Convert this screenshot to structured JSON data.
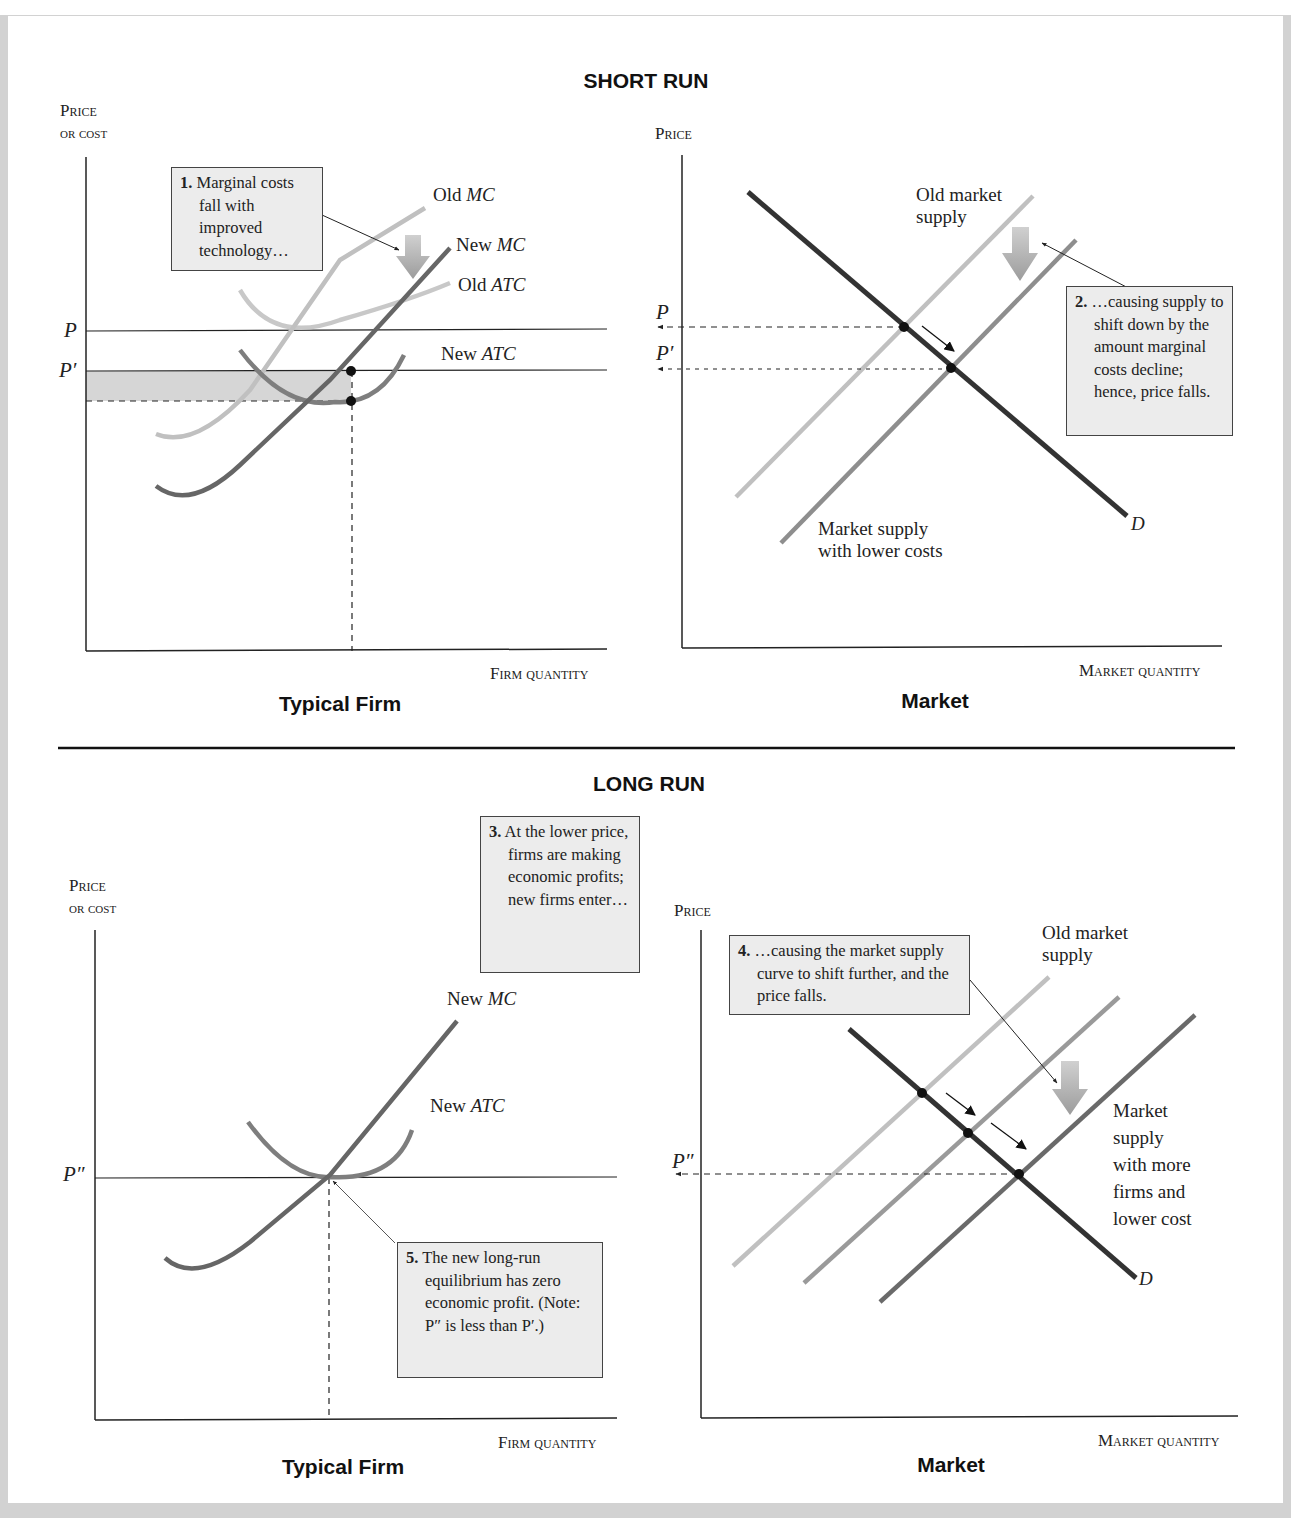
{
  "sections": {
    "short_run": {
      "title": "SHORT RUN",
      "firm": {
        "subtitle": "Typical Firm",
        "y_axis": "Price or cost",
        "y_axis_line1": "Price",
        "y_axis_line2": "or cost",
        "x_axis": "Firm quantity",
        "price_labels": [
          "P",
          "P′"
        ],
        "curve_labels": {
          "old_mc": {
            "prefix": "Old ",
            "name": "MC"
          },
          "new_mc": {
            "prefix": "New ",
            "name": "MC"
          },
          "old_atc": {
            "prefix": "Old ",
            "name": "ATC"
          },
          "new_atc": {
            "prefix": "New ",
            "name": "ATC"
          }
        },
        "note": {
          "number": "1.",
          "text": "Marginal costs fall with improved technology…"
        }
      },
      "market": {
        "subtitle": "Market",
        "y_axis": "Price",
        "x_axis": "Market quantity",
        "price_labels": [
          "P",
          "P′"
        ],
        "curve_labels": {
          "old_supply": "Old market\nsupply",
          "new_supply": "Market supply\nwith lower costs",
          "demand": "D"
        },
        "note": {
          "number": "2.",
          "text": "…causing supply to shift down by the amount marginal costs decline; hence, price falls."
        }
      }
    },
    "long_run": {
      "title": "LONG RUN",
      "firm": {
        "subtitle": "Typical Firm",
        "y_axis_line1": "Price",
        "y_axis_line2": "or cost",
        "x_axis": "Firm quantity",
        "price_labels": [
          "P″"
        ],
        "curve_labels": {
          "new_mc": {
            "prefix": "New ",
            "name": "MC"
          },
          "new_atc": {
            "prefix": "New ",
            "name": "ATC"
          }
        },
        "note3": {
          "number": "3.",
          "text": "At the lower price, firms are making economic profits; new firms enter…"
        },
        "note5": {
          "number": "5.",
          "text": "The new long-run equilibrium has zero economic profit. (Note: P″ is less than P′.)"
        }
      },
      "market": {
        "subtitle": "Market",
        "y_axis": "Price",
        "x_axis": "Market quantity",
        "price_labels": [
          "P″"
        ],
        "curve_labels": {
          "old_supply": "Old market\nsupply",
          "new_supply": "Market\nsupply\nwith more\nfirms and\nlower cost",
          "demand": "D"
        },
        "note": {
          "number": "4.",
          "text": "…causing the market supply curve to shift further, and the price falls."
        }
      }
    }
  },
  "colors": {
    "frame": "#d2d2d2",
    "old_curve": "#bdbdbd",
    "mid_curve": "#9a9a9a",
    "new_curve": "#6a6a6a",
    "demand": "#3a3a3a",
    "profit_shade": "#d6d6d6",
    "note_bg": "#ececec",
    "shift_arrow": "#a8a8a8"
  }
}
